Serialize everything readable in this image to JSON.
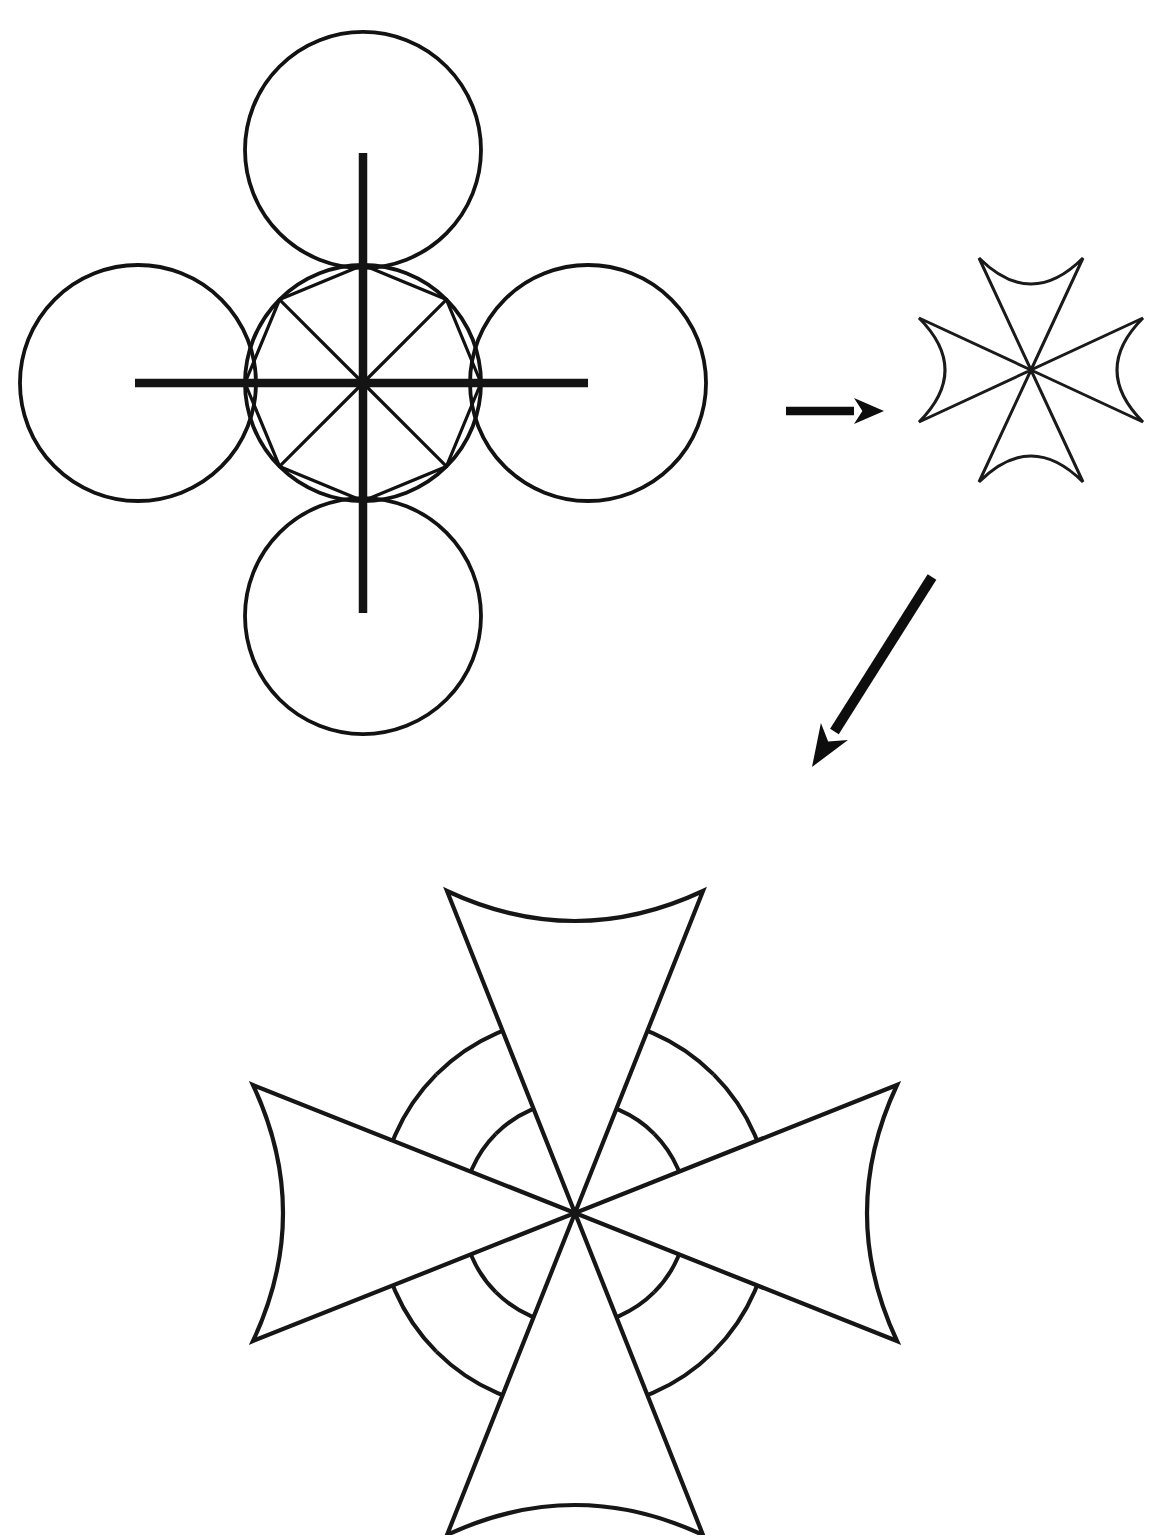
{
  "document": {
    "title": "Maltese Cross Geometric Construction",
    "description": "Compass-and-straightedge construction of a Maltese (pattee) cross: four tangent circles around a central circle with an inscribed octagon and eight radial spokes, reduced to a small cross, then enlarged.",
    "background_color": "#ffffff",
    "ink_color": "#111111",
    "width": 1160,
    "height": 1535
  },
  "panels": [
    {
      "id": "construction",
      "name": "construction-diagram",
      "label": "Compass construction: four petal circles, central circle, inscribed octagon, eight spokes"
    },
    {
      "id": "small-cross",
      "name": "small-cross-result",
      "label": "Resulting small Maltese cross"
    },
    {
      "id": "large-cross",
      "name": "large-cross-result",
      "label": "Enlarged Maltese cross with construction arcs retained"
    }
  ],
  "geometry": {
    "construction": {
      "center_x": 363,
      "center_y": 383,
      "circle_radius": 118,
      "petal_count": 4,
      "petal_offsets": [
        {
          "name": "north",
          "dx": 0,
          "dy": -233
        },
        {
          "name": "east",
          "dx": 225,
          "dy": 0
        },
        {
          "name": "south",
          "dx": 0,
          "dy": 233
        },
        {
          "name": "west",
          "dx": -225,
          "dy": 0
        }
      ],
      "spoke_count": 8,
      "spoke_angles_deg": [
        0,
        45,
        90,
        135,
        180,
        225,
        270,
        315
      ],
      "octagon_vertices": 8,
      "axis_horizontal": {
        "x1": 135,
        "x2": 588,
        "y": 383
      },
      "axis_vertical": {
        "y1": 153,
        "y2": 613,
        "x": 363
      }
    },
    "small_cross": {
      "center_x": 1031,
      "center_y": 370,
      "arm_length": 112,
      "arm_half_width": 52,
      "concavity": 26,
      "arm_count": 4
    },
    "large_cross": {
      "center_x": 575,
      "center_y": 1213,
      "arm_length": 322,
      "arm_half_width": 128,
      "concavity": 30,
      "arm_count": 4,
      "guide_arc_outer_radius": 196,
      "guide_arc_inner_radius": 112
    }
  },
  "arrows": [
    {
      "name": "arrow-to-small-cross",
      "direction": "right",
      "x1": 786,
      "y1": 411,
      "x2": 884,
      "y2": 411,
      "head_length": 30,
      "head_half_width": 13
    },
    {
      "name": "arrow-to-large-cross",
      "direction": "down-left",
      "x1": 932,
      "y1": 577,
      "x2": 812,
      "y2": 767,
      "head_length": 42,
      "head_half_width": 16
    }
  ],
  "chart_data": {
    "type": "diagram",
    "steps": [
      "Draw a central circle of radius r.",
      "Draw four equal circles of radius r tangent at north, east, south and west.",
      "Mark eight equally spaced points on the central circle and join them to form an octagon with eight radial spokes.",
      "Trace four triangular arms whose outer edges are concave arcs to obtain the Maltese cross.",
      "Enlarge the resulting cross, keeping the construction arcs visible between the arms."
    ],
    "symmetry": "4-fold rotational (C4v), 8 radial divisions at 45 degrees"
  }
}
